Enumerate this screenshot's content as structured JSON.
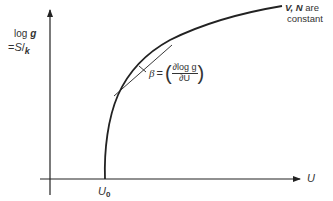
{
  "diagram": {
    "y_axis_label_line1": "log",
    "y_axis_label_var": "g",
    "y_axis_label_eq": "=",
    "y_axis_label_S": "S",
    "y_axis_label_slash": "/",
    "y_axis_label_k": "k",
    "x_axis_label": "U",
    "origin_marker": "U",
    "origin_marker_sub": "0",
    "curve_annotation_vars": "V, N",
    "curve_annotation_are": " are",
    "curve_annotation_line2": "constant",
    "slope_label_beta": "β",
    "slope_label_eq": "=",
    "slope_label_paren_open": "(",
    "slope_label_numerator": "∂log g",
    "slope_label_denominator": "∂U",
    "slope_label_paren_close": ")"
  },
  "colors": {
    "stroke": "#222222",
    "text": "#333333",
    "background": "#ffffff"
  }
}
